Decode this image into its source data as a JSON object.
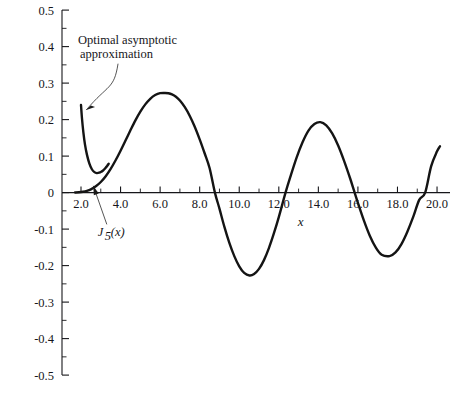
{
  "chart_data": {
    "type": "line",
    "title": "",
    "xlabel": "x",
    "ylabel": "",
    "xlim": [
      1.5,
      20.5
    ],
    "ylim": [
      -0.5,
      0.5
    ],
    "grid": false,
    "legend": "none",
    "x_ticks_major": [
      "2.0",
      "4.0",
      "6.0",
      "8.0",
      "10.0",
      "12.0",
      "14.0",
      "16.0",
      "18.0",
      "20.0"
    ],
    "x_tick_values": [
      2.0,
      4.0,
      6.0,
      8.0,
      10.0,
      12.0,
      14.0,
      16.0,
      18.0,
      20.0
    ],
    "x_minor_step": 1.0,
    "y_ticks_major": [
      "0.5",
      "0.4",
      "0.3",
      "0.2",
      "0.1",
      "0",
      "-0.1",
      "-0.2",
      "-0.3",
      "-0.4",
      "-0.5"
    ],
    "y_tick_values": [
      0.5,
      0.4,
      0.3,
      0.2,
      0.1,
      0.0,
      -0.1,
      -0.2,
      -0.3,
      -0.4,
      -0.5
    ],
    "y_minor_step": 0.05,
    "series": [
      {
        "name": "J_5(x)",
        "label": "J",
        "label_sub": "5",
        "label_arg": "(x)",
        "x": [
          1.7,
          1.9,
          2.1,
          2.3,
          2.5,
          2.75,
          3.0,
          3.25,
          3.5,
          3.75,
          4.0,
          4.25,
          4.5,
          4.75,
          5.0,
          5.25,
          5.5,
          5.75,
          6.0,
          6.25,
          6.42,
          6.6,
          6.8,
          7.0,
          7.25,
          7.5,
          7.75,
          8.0,
          8.25,
          8.5,
          8.77,
          9.0,
          9.25,
          9.5,
          9.75,
          10.0,
          10.25,
          10.52,
          10.75,
          11.0,
          11.25,
          11.5,
          11.75,
          12.0,
          12.34,
          12.6,
          12.9,
          13.2,
          13.5,
          13.8,
          14.1,
          14.4,
          14.7,
          15.0,
          15.3,
          15.6,
          15.8,
          16.0,
          16.3,
          16.6,
          16.9,
          17.2,
          17.6,
          17.9,
          18.2,
          18.5,
          18.8,
          19.1,
          19.4,
          19.7,
          20.0,
          20.15
        ],
        "y": [
          0.0004,
          0.001,
          0.0023,
          0.0048,
          0.009,
          0.0172,
          0.029,
          0.0448,
          0.0648,
          0.0885,
          0.1148,
          0.1427,
          0.1708,
          0.1978,
          0.2218,
          0.2417,
          0.257,
          0.2672,
          0.2724,
          0.273,
          0.2722,
          0.269,
          0.2625,
          0.2522,
          0.234,
          0.21,
          0.1805,
          0.146,
          0.1078,
          0.0672,
          0.0,
          -0.044,
          -0.094,
          -0.1378,
          -0.174,
          -0.202,
          -0.22,
          -0.227,
          -0.223,
          -0.209,
          -0.185,
          -0.152,
          -0.112,
          -0.067,
          0.0,
          0.046,
          0.096,
          0.138,
          0.17,
          0.188,
          0.193,
          0.184,
          0.162,
          0.129,
          0.087,
          0.04,
          0.006,
          -0.028,
          -0.076,
          -0.118,
          -0.15,
          -0.17,
          -0.174,
          -0.164,
          -0.141,
          -0.107,
          -0.066,
          -0.02,
          0.0,
          0.072,
          0.113,
          0.127
        ],
        "maxima": [
          {
            "x": 6.42,
            "y": 0.273
          },
          {
            "x": 14.1,
            "y": 0.193
          }
        ],
        "minima": [
          {
            "x": 10.52,
            "y": -0.227
          },
          {
            "x": 17.6,
            "y": -0.174
          }
        ],
        "zeros": [
          8.77,
          12.34,
          15.7,
          19.4
        ]
      },
      {
        "name": "Optimal asymptotic approximation",
        "x": [
          2.0,
          2.05,
          2.12,
          2.2,
          2.3,
          2.42,
          2.55,
          2.68,
          2.8,
          2.92,
          3.02,
          3.1,
          3.18,
          3.25,
          3.32,
          3.4
        ],
        "y": [
          0.24,
          0.203,
          0.165,
          0.132,
          0.104,
          0.08,
          0.064,
          0.056,
          0.0535,
          0.0545,
          0.057,
          0.06,
          0.064,
          0.068,
          0.073,
          0.079
        ]
      }
    ],
    "annotations": [
      {
        "id": "optimal-asymptotic-approximation",
        "line1": "Optimal asymptotic",
        "line2": "approximation",
        "text_x": 1.85,
        "text_y": 0.408,
        "target_x": 2.06,
        "target_y": 0.218
      },
      {
        "id": "j5-label",
        "line1": "J",
        "sub": "5",
        "line2": "(x)",
        "text_x": 2.85,
        "text_y": -0.12,
        "target_x": 2.52,
        "target_y": 0.013
      }
    ],
    "colors": {
      "curve": "#141414",
      "axis": "#16161a",
      "background": "#ffffff",
      "leader": "#2a2a2a"
    }
  }
}
